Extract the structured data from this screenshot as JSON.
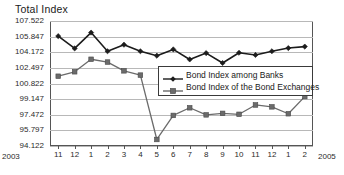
{
  "chart_data": {
    "type": "line",
    "title": "Total Index",
    "xlabel": "",
    "ylabel": "",
    "grid": true,
    "legend_position": "center-right-inside",
    "categories": [
      "11",
      "12",
      "1",
      "2",
      "3",
      "4",
      "5",
      "6",
      "7",
      "8",
      "9",
      "10",
      "11",
      "12",
      "1",
      "2"
    ],
    "x_start_year": "2003",
    "x_end_year": "2005",
    "ylim": [
      94.122,
      107.522
    ],
    "yticks": [
      "107.522",
      "105.847",
      "104.172",
      "102.497",
      "100.822",
      "99.147",
      "97.472",
      "95.797",
      "94.122"
    ],
    "ytick_values": [
      107.522,
      105.847,
      104.172,
      102.497,
      100.822,
      99.147,
      97.472,
      95.797,
      94.122
    ],
    "series": [
      {
        "name": "Bond Index among Banks",
        "marker": "diamond",
        "color": "#1c1c1c",
        "values": [
          105.9,
          104.58,
          106.28,
          104.28,
          104.98,
          104.28,
          103.8,
          104.48,
          103.4,
          104.08,
          103.02,
          104.12,
          103.88,
          104.28,
          104.62,
          104.78
        ]
      },
      {
        "name": "Bond Index of the Bond Exchanges",
        "marker": "square",
        "color": "#6b6b6b",
        "values": [
          101.6,
          102.08,
          103.42,
          103.12,
          102.18,
          101.72,
          94.82,
          97.4,
          98.22,
          97.46,
          97.62,
          97.52,
          98.52,
          98.32,
          97.58,
          99.42
        ]
      }
    ]
  },
  "axis": {
    "year_left": "2003",
    "year_right": "2005"
  }
}
